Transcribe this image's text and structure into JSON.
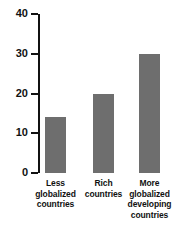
{
  "chart_data": {
    "type": "bar",
    "title": "",
    "subtitle_partial": "",
    "xlabel": "",
    "ylabel": "",
    "categories": [
      "Less globalized countries",
      "Rich countries",
      "More globalized developing countries"
    ],
    "category_lines": [
      [
        "Less",
        "globalized",
        "countries"
      ],
      [
        "Rich",
        "countries"
      ],
      [
        "More",
        "globalized",
        "developing",
        "countries"
      ]
    ],
    "values": [
      14,
      20,
      30
    ],
    "ylim": [
      0,
      40
    ],
    "yticks": [
      0,
      10,
      20,
      30,
      40
    ],
    "ytick_labels": [
      "0",
      "10",
      "20",
      "30",
      "40"
    ],
    "grid": false,
    "legend": false,
    "bar_color": "#6e6e6e",
    "axis_color": "#111111",
    "text_color": "#111111",
    "background": "#ffffff"
  },
  "axis": {
    "ticks": [
      {
        "label": "40",
        "value": 40
      },
      {
        "label": "30",
        "value": 30
      },
      {
        "label": "20",
        "value": 20
      },
      {
        "label": "10",
        "value": 10
      },
      {
        "label": "0",
        "value": 0
      }
    ]
  },
  "bars": [
    {
      "name": "less-globalized-countries",
      "value": 14,
      "lines": [
        "Less",
        "globalized",
        "countries"
      ]
    },
    {
      "name": "rich-countries",
      "value": 20,
      "lines": [
        "Rich",
        "countries"
      ]
    },
    {
      "name": "more-globalized-developing-countries",
      "value": 30,
      "lines": [
        "More",
        "globalized",
        "developing",
        "countries"
      ]
    }
  ]
}
